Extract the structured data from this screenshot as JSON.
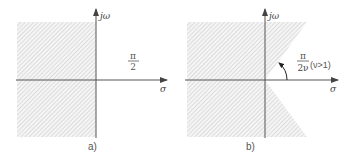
{
  "panels": [
    {
      "id": "a",
      "caption": "a)",
      "y_axis_label": "jω",
      "x_axis_label": "σ",
      "angle_label": {
        "numerator": "π",
        "denominator": "2"
      },
      "region": "left half-plane (Re s < 0) shaded"
    },
    {
      "id": "b",
      "caption": "b)",
      "y_axis_label": "jω",
      "x_axis_label": "σ",
      "angle_label": {
        "numerator": "π",
        "denominator": "2ν",
        "condition": "(ν>1)"
      },
      "region": "plane shaded except sector |arg s| < π/(2ν)"
    }
  ],
  "colors": {
    "axis": "#555555",
    "hatch": "#cfcfcf",
    "hatch_bg": "#f4f4f4"
  }
}
